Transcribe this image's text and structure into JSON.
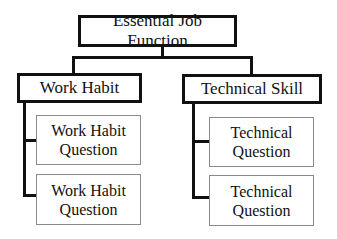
{
  "diagram": {
    "root": {
      "label": "Essential Job Function"
    },
    "categories": [
      {
        "label": "Work Habit",
        "children": [
          {
            "label": "Work Habit Question"
          },
          {
            "label": "Work Habit Question"
          }
        ]
      },
      {
        "label": "Technical Skill",
        "children": [
          {
            "label": "Technical Question"
          },
          {
            "label": "Technical Question"
          }
        ]
      }
    ],
    "colors": {
      "line": "#111111",
      "thin_border": "#8a8a8a",
      "background": "#ffffff"
    }
  }
}
